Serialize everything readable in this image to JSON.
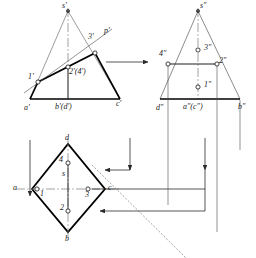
{
  "drawing": {
    "title": "Three-view orthographic projection of a pyramid with a cutting line",
    "type": "engineering-drawing",
    "colors": {
      "outline": "#000000",
      "thin": "#3a3a3a",
      "center": "#6b6b6b",
      "projection": "#555555",
      "point_fill": "#ffffff"
    },
    "views": {
      "front": {
        "name": "front-view",
        "labels": {
          "apex": "s'",
          "left_base": "a'",
          "mid_base": "b'(d')",
          "right_base": "c'",
          "p1": "1'",
          "p2": "2'(4')",
          "p3": "3'",
          "line": "p'"
        }
      },
      "side": {
        "name": "side-view",
        "labels": {
          "apex": "s″",
          "left_base": "d″",
          "mid_base": "a″(c″)",
          "right_base": "b″",
          "p1": "1″",
          "p2": "2″",
          "p3": "3″",
          "p4": "4″"
        }
      },
      "top": {
        "name": "top-view",
        "labels": {
          "left": "a",
          "bottom": "b",
          "right": "c",
          "top": "d",
          "center": "s",
          "p1": "1",
          "p2": "2",
          "p3": "3",
          "p4": "4"
        }
      }
    },
    "mitre": {
      "name": "45-degree-mitre-line"
    }
  }
}
